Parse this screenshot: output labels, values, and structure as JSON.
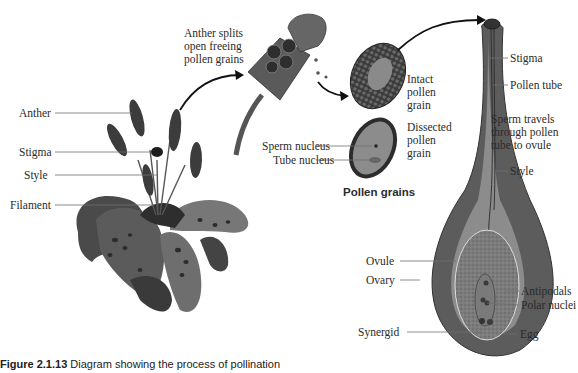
{
  "figure": {
    "caption_number": "Figure 2.1.13",
    "caption_text": "Diagram showing the process of pollination"
  },
  "flower_labels": {
    "anther": "Anther",
    "stigma": "Stigma",
    "style": "Style",
    "filament": "Filament"
  },
  "anther_detail": {
    "line1": "Anther splits",
    "line2": "open freeing",
    "line3": "pollen grains"
  },
  "pollen": {
    "intact_line1": "Intact",
    "intact_line2": "pollen",
    "intact_line3": "grain",
    "dissected_line1": "Dissected",
    "dissected_line2": "pollen",
    "dissected_line3": "grain",
    "sperm_nucleus": "Sperm nucleus",
    "tube_nucleus": "Tube nucleus",
    "heading": "Pollen grains"
  },
  "pistil_labels": {
    "stigma": "Stigma",
    "pollen_tube": "Pollen tube",
    "note_line1": "Sperm travels",
    "note_line2": "through pollen",
    "note_line3": "tube to ovule",
    "style": "Style",
    "ovule": "Ovule",
    "ovary": "Ovary",
    "antipodals": "Antipodals",
    "polar_nuclei": "Polar nuclei",
    "synergid": "Synergid",
    "egg": "Egg"
  },
  "colors": {
    "ink": "#2b2b2b",
    "leader": "#6e6e6e",
    "flower_dark": "#2e2e2e",
    "flower_mid": "#5a5a5a",
    "pistil_outer": "#5c5c5c",
    "pistil_inner": "#8a8a8a",
    "ovule_fill": "#7a7a7a"
  }
}
